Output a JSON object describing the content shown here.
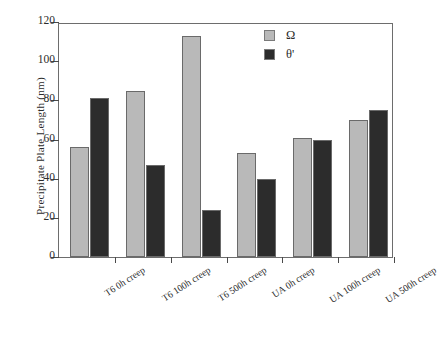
{
  "chart_data": {
    "type": "bar",
    "title": "",
    "xlabel": "",
    "ylabel": "Precipitate Plate Length (nm)",
    "ylim": [
      0,
      120
    ],
    "yticks": [
      0,
      20,
      40,
      60,
      80,
      100,
      120
    ],
    "ytick_labels": [
      "0",
      "20",
      "40",
      "60",
      "80",
      "100",
      "120"
    ],
    "grid": false,
    "legend_position": "top-right",
    "categories": [
      "T6 0h creep",
      "T6 100h creep",
      "T6 500h creep",
      "UA 0h creep",
      "UA 100h creep",
      "UA 500h creep"
    ],
    "series": [
      {
        "name": "Ω",
        "color": "#b9b9b9",
        "values": [
          56,
          85,
          113,
          53,
          61,
          70
        ]
      },
      {
        "name": "θ'",
        "color": "#2c2c2c",
        "values": [
          81,
          47,
          24,
          40,
          60,
          75
        ]
      }
    ]
  },
  "axis": {
    "y_title": "Precipitate Plate Length (nm)",
    "frame_color": "#6d6d6d",
    "tick_color": "#4a4a4a"
  },
  "legend": {
    "entries": [
      {
        "label": "Ω",
        "color": "#b9b9b9"
      },
      {
        "label": "θ'",
        "color": "#2c2c2c"
      }
    ]
  }
}
